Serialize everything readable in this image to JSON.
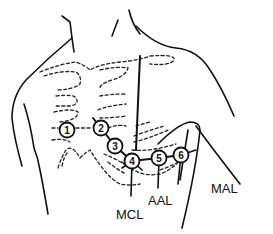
{
  "figure": {
    "type": "anatomical-diagram"
  },
  "electrodes": [
    {
      "label": "1",
      "x": 67,
      "y": 130
    },
    {
      "label": "2",
      "x": 101,
      "y": 128
    },
    {
      "label": "3",
      "x": 115,
      "y": 146
    },
    {
      "label": "4",
      "x": 132,
      "y": 161
    },
    {
      "label": "5",
      "x": 159,
      "y": 158
    },
    {
      "label": "6",
      "x": 181,
      "y": 155
    }
  ],
  "reference_lines": [
    {
      "label": "MCL",
      "x": 116,
      "y": 208
    },
    {
      "label": "AAL",
      "x": 148,
      "y": 194
    },
    {
      "label": "MAL",
      "x": 211,
      "y": 182
    }
  ],
  "colors": {
    "line": "#111111",
    "background": "#ffffff"
  }
}
